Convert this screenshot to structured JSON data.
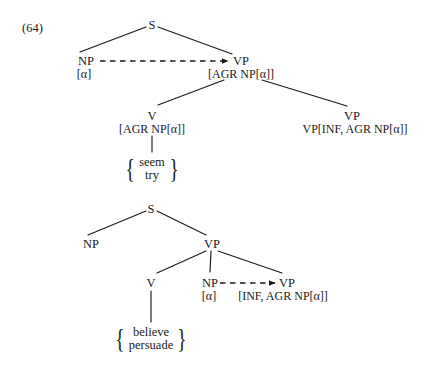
{
  "example": {
    "number": "(64)"
  },
  "tree_top": {
    "nodes": [
      {
        "id": "s",
        "label": "S",
        "x": 152,
        "y": 19
      },
      {
        "id": "np",
        "label": "NP",
        "x": 86,
        "y": 55
      },
      {
        "id": "np_feat",
        "label": "[α]",
        "x": 84,
        "y": 68
      },
      {
        "id": "vp",
        "label": "VP",
        "x": 241,
        "y": 55
      },
      {
        "id": "vp_feat",
        "label": "[AGR NP[α]]",
        "x": 241,
        "y": 68
      },
      {
        "id": "v",
        "label": "V",
        "x": 152,
        "y": 110
      },
      {
        "id": "v_feat",
        "label": "[AGR NP[α]]",
        "x": 152,
        "y": 123
      },
      {
        "id": "vp2",
        "label": "VP",
        "x": 352,
        "y": 110
      },
      {
        "id": "vp2_feat",
        "label": "VP[INF, AGR NP[α]]",
        "x": 355,
        "y": 123
      }
    ],
    "lexical_set": {
      "x": 152,
      "y": 158,
      "items": [
        "seem",
        "try"
      ]
    }
  },
  "tree_bottom": {
    "nodes": [
      {
        "id": "s",
        "label": "S",
        "x": 151,
        "y": 203
      },
      {
        "id": "np",
        "label": "NP",
        "x": 91,
        "y": 238
      },
      {
        "id": "vp",
        "label": "VP",
        "x": 212,
        "y": 238
      },
      {
        "id": "v",
        "label": "V",
        "x": 151,
        "y": 277
      },
      {
        "id": "np2",
        "label": "NP",
        "x": 210,
        "y": 277
      },
      {
        "id": "np2_feat",
        "label": "[α]",
        "x": 209,
        "y": 290
      },
      {
        "id": "vp2",
        "label": "VP",
        "x": 287,
        "y": 277
      },
      {
        "id": "vp2_feat",
        "label": "[INF, AGR NP[α]]",
        "x": 283,
        "y": 290
      }
    ],
    "lexical_set": {
      "x": 151,
      "y": 328,
      "items": [
        "believe",
        "persuade"
      ]
    }
  },
  "style": {
    "ink": "#1a1a1a",
    "background": "#ffffff"
  }
}
